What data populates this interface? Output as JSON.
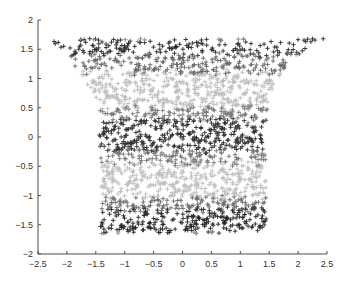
{
  "chart_data": {
    "type": "scatter",
    "title": "",
    "xlabel": "",
    "ylabel": "",
    "xlim": [
      -2.5,
      2.5
    ],
    "ylim": [
      -2,
      2
    ],
    "grid": false,
    "legend": null,
    "marker": "+",
    "box": false,
    "x_ticks": [
      -2.5,
      -2,
      -1.5,
      -1,
      -0.5,
      0,
      0.5,
      1,
      1.5,
      2,
      2.5
    ],
    "x_tick_labels": [
      "-2.5",
      "-2",
      "-1.5",
      "-1",
      "-0.5",
      "0",
      "0.5",
      "1",
      "1.5",
      "2",
      "2.5"
    ],
    "y_ticks": [
      2,
      1.5,
      1,
      0.5,
      0,
      -0.5,
      -1,
      -1.5,
      -2
    ],
    "y_tick_labels": [
      "2",
      "1.5",
      "1",
      "0.5",
      "0",
      "-0.5",
      "-1",
      "-1.5",
      "-2"
    ],
    "shape_profile": {
      "y": [
        1.68,
        1.5,
        1.2,
        0.9,
        0.6,
        0.3,
        0.0,
        -0.5,
        -1.0,
        -1.5,
        -1.65
      ],
      "x_left": [
        -2.3,
        -2.1,
        -1.85,
        -1.65,
        -1.5,
        -1.42,
        -1.45,
        -1.42,
        -1.4,
        -1.42,
        -1.42
      ],
      "x_right": [
        2.45,
        2.1,
        1.8,
        1.6,
        1.5,
        1.45,
        1.42,
        1.45,
        1.45,
        1.45,
        1.42
      ]
    },
    "gray_bands": [
      {
        "y_from": 1.68,
        "y_to": 1.4,
        "gray": "#2a2a2a"
      },
      {
        "y_from": 1.4,
        "y_to": 1.1,
        "gray": "#6a6a6a"
      },
      {
        "y_from": 1.1,
        "y_to": 0.5,
        "gray": "#bdbdbd"
      },
      {
        "y_from": 0.5,
        "y_to": 0.3,
        "gray": "#7a7a7a"
      },
      {
        "y_from": 0.3,
        "y_to": -0.25,
        "gray": "#303030"
      },
      {
        "y_from": -0.25,
        "y_to": -0.45,
        "gray": "#777777"
      },
      {
        "y_from": -0.45,
        "y_to": -1.05,
        "gray": "#c0c0c0"
      },
      {
        "y_from": -1.05,
        "y_to": -1.25,
        "gray": "#6e6e6e"
      },
      {
        "y_from": -1.25,
        "y_to": -1.65,
        "gray": "#262626"
      }
    ],
    "point_count": 2200,
    "random_seed": 7
  },
  "plot_area": {
    "x_px": [
      38,
      327
    ],
    "y_px": [
      20,
      254
    ]
  }
}
